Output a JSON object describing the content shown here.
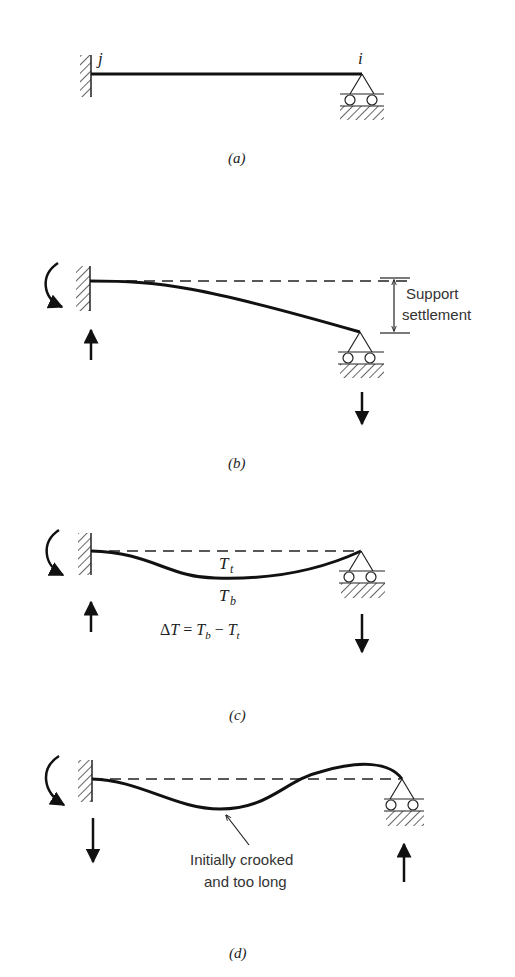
{
  "panels": [
    {
      "id": "a",
      "caption": "(a)",
      "node_labels": {
        "left": "j",
        "right": "i"
      },
      "description": "Propped cantilever: fixed at j, roller at i"
    },
    {
      "id": "b",
      "caption": "(b)",
      "annotation": [
        "Support",
        "settlement"
      ],
      "description": "Roller support at i settles downward"
    },
    {
      "id": "c",
      "caption": "(c)",
      "labels": {
        "top_temp": "T",
        "top_sub": "t",
        "bottom_temp": "T",
        "bottom_sub": "b"
      },
      "equation": "ΔT = Tb − Tt",
      "description": "Temperature gradient through depth"
    },
    {
      "id": "d",
      "caption": "(d)",
      "annotation": [
        "Initially crooked",
        "and too long"
      ],
      "description": "Fabrication error: member initially crooked and too long"
    }
  ],
  "colors": {
    "ink": "#111111",
    "background": "#ffffff"
  }
}
